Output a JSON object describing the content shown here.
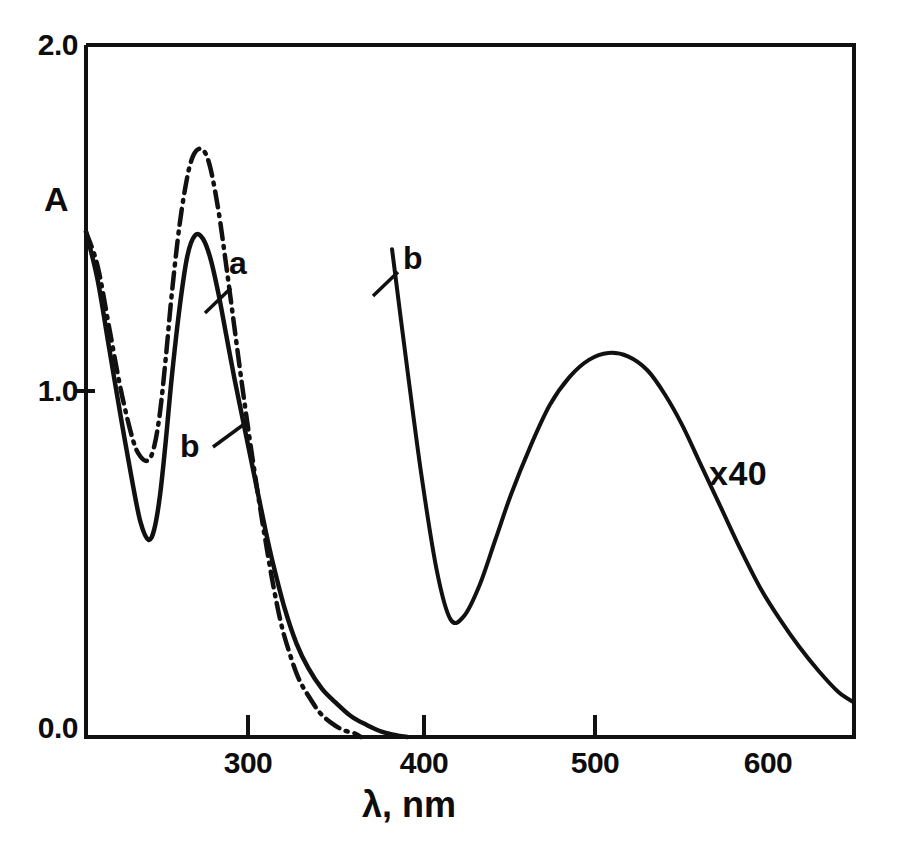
{
  "chart_data": {
    "type": "line",
    "title": "",
    "subtitle": "",
    "xlabel": "λ, nm",
    "ylabel": "A",
    "xlim": [
      206,
      600
    ],
    "ylim": [
      0.0,
      2.0
    ],
    "grid": false,
    "legend_position": "inline-annotations",
    "x_ticks": [
      300,
      400,
      500,
      600
    ],
    "x_tick_labels": [
      "300",
      "400",
      "500",
      "600"
    ],
    "y_ticks": [
      0.0,
      1.0,
      2.0
    ],
    "y_tick_labels": [
      "0.0",
      "1.0",
      "2.0"
    ],
    "annotations": [
      {
        "text": "a",
        "x": 286,
        "y": 1.48,
        "note": "label for dash-dot spectrum, UV region"
      },
      {
        "text": "b",
        "x": 266,
        "y": 0.92,
        "note": "label for solid spectrum, UV region"
      },
      {
        "text": "b",
        "x": 390,
        "y": 1.4,
        "note": "label for solid spectrum, visible region"
      },
      {
        "text": "x40",
        "x": 570,
        "y": 0.78,
        "note": "visible band magnified 40 times"
      }
    ],
    "series": [
      {
        "name": "a",
        "style": "dash-dot",
        "color": "#111111",
        "region": "uv",
        "x": [
          206,
          212,
          218,
          224,
          230,
          234,
          238,
          241,
          244,
          247,
          250,
          254,
          258,
          261,
          264,
          267,
          270,
          274,
          278,
          282,
          286,
          290,
          294,
          298,
          302,
          306,
          310,
          315,
          320,
          326,
          332,
          338,
          344,
          347
        ],
        "y": [
          1.46,
          1.36,
          1.18,
          1.0,
          0.86,
          0.81,
          0.8,
          0.84,
          0.94,
          1.1,
          1.28,
          1.48,
          1.62,
          1.68,
          1.7,
          1.69,
          1.64,
          1.52,
          1.36,
          1.19,
          1.02,
          0.86,
          0.71,
          0.57,
          0.44,
          0.33,
          0.25,
          0.17,
          0.12,
          0.07,
          0.04,
          0.02,
          0.01,
          0.0
        ]
      },
      {
        "name": "b",
        "style": "solid",
        "color": "#111111",
        "region": "uv",
        "x": [
          206,
          212,
          218,
          224,
          230,
          234,
          238,
          241,
          244,
          247,
          250,
          254,
          258,
          262,
          266,
          270,
          274,
          278,
          282,
          286,
          290,
          294,
          298,
          302,
          308,
          314,
          320,
          327,
          334,
          342,
          350,
          358,
          366,
          371
        ],
        "y": [
          1.46,
          1.32,
          1.12,
          0.92,
          0.73,
          0.62,
          0.57,
          0.6,
          0.7,
          0.86,
          1.04,
          1.24,
          1.39,
          1.45,
          1.44,
          1.38,
          1.28,
          1.16,
          1.04,
          0.93,
          0.82,
          0.71,
          0.6,
          0.5,
          0.37,
          0.27,
          0.2,
          0.14,
          0.1,
          0.06,
          0.035,
          0.015,
          0.004,
          0.0
        ]
      },
      {
        "name": "b",
        "style": "solid",
        "color": "#111111",
        "region": "visible",
        "scale_note": "x40",
        "x": [
          363,
          370,
          378,
          386,
          393,
          400,
          408,
          416,
          424,
          434,
          444,
          454,
          464,
          474,
          484,
          494,
          503,
          512,
          522,
          532,
          542,
          552,
          562,
          572,
          582,
          592,
          600
        ],
        "y": [
          1.41,
          1.1,
          0.76,
          0.48,
          0.34,
          0.35,
          0.44,
          0.57,
          0.7,
          0.84,
          0.96,
          1.04,
          1.09,
          1.11,
          1.1,
          1.06,
          0.99,
          0.9,
          0.78,
          0.66,
          0.54,
          0.43,
          0.34,
          0.26,
          0.19,
          0.13,
          0.1
        ]
      }
    ]
  },
  "axes": {
    "y_label": "A",
    "x_label": "λ, nm",
    "y_tick_0": "0.0",
    "y_tick_1": "1.0",
    "y_tick_2": "2.0",
    "x_tick_300": "300",
    "x_tick_400": "400",
    "x_tick_500": "500",
    "x_tick_600": "600"
  },
  "labels": {
    "curve_a_uv": "a",
    "curve_b_uv": "b",
    "curve_b_vis": "b",
    "magnification": "x40"
  },
  "colors": {
    "ink": "#111111",
    "background": "#ffffff"
  }
}
